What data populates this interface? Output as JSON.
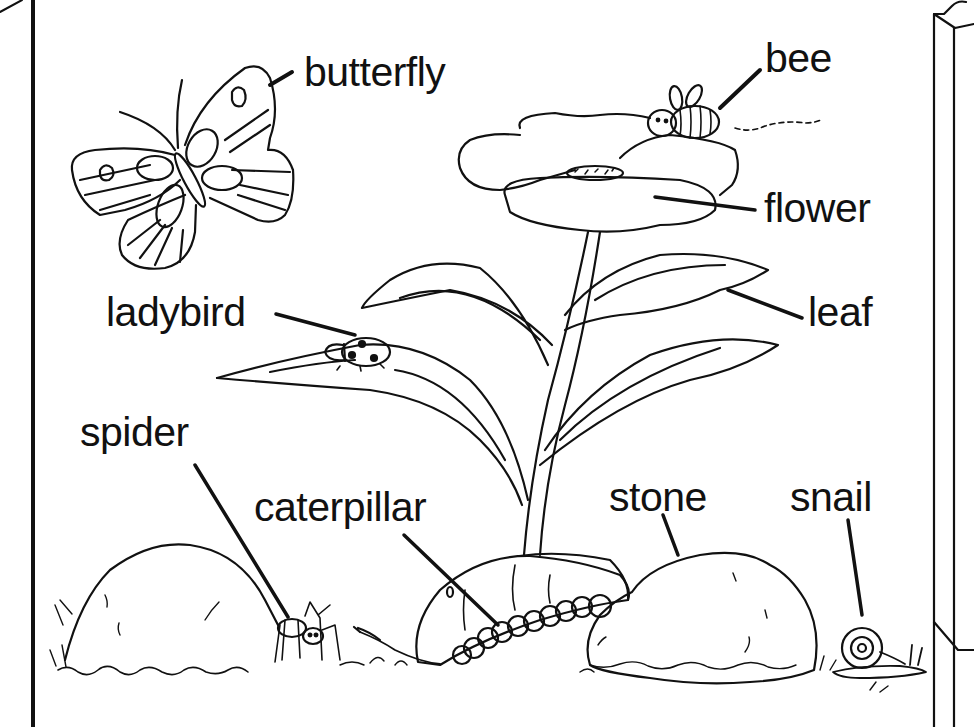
{
  "diagram": {
    "type": "labeled-illustration",
    "ink_color": "#111111",
    "background_color": "#ffffff",
    "labels": [
      {
        "id": "butterfly",
        "text": "butterfly",
        "x": 304,
        "y": 52
      },
      {
        "id": "bee",
        "text": "bee",
        "x": 765,
        "y": 38
      },
      {
        "id": "flower",
        "text": "flower",
        "x": 764,
        "y": 188
      },
      {
        "id": "leaf",
        "text": "leaf",
        "x": 808,
        "y": 292
      },
      {
        "id": "ladybird",
        "text": "ladybird",
        "x": 106,
        "y": 292
      },
      {
        "id": "spider",
        "text": "spider",
        "x": 80,
        "y": 412
      },
      {
        "id": "caterpillar",
        "text": "caterpillar",
        "x": 254,
        "y": 487
      },
      {
        "id": "stone",
        "text": "stone",
        "x": 609,
        "y": 477
      },
      {
        "id": "snail",
        "text": "snail",
        "x": 790,
        "y": 477
      }
    ]
  }
}
